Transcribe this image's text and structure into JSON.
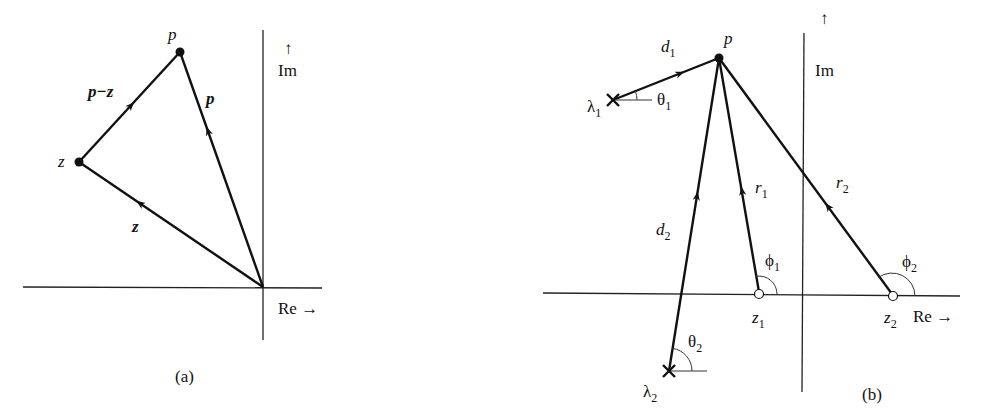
{
  "panel_a": {
    "caption": "(a)",
    "axis_re": "Re →",
    "axis_im_arrow": "↑",
    "axis_im": "Im",
    "point_p": "p",
    "point_z": "z",
    "vector_p": "p",
    "vector_z": "z",
    "vector_p_minus_z": "p−z"
  },
  "panel_b": {
    "caption": "(b)",
    "axis_re": "Re →",
    "axis_im_arrow": "↑",
    "axis_im": "Im",
    "point_p": "p",
    "pole_1": "λ",
    "pole_1_sub": "1",
    "pole_2": "λ",
    "pole_2_sub": "2",
    "zero_1": "z",
    "zero_1_sub": "1",
    "zero_2": "z",
    "zero_2_sub": "2",
    "d1": "d",
    "d1_sub": "1",
    "d2": "d",
    "d2_sub": "2",
    "r1": "r",
    "r1_sub": "1",
    "r2": "r",
    "r2_sub": "2",
    "theta1": "θ",
    "theta1_sub": "1",
    "theta2": "θ",
    "theta2_sub": "2",
    "phi1": "ϕ",
    "phi1_sub": "1",
    "phi2": "ϕ",
    "phi2_sub": "2"
  }
}
